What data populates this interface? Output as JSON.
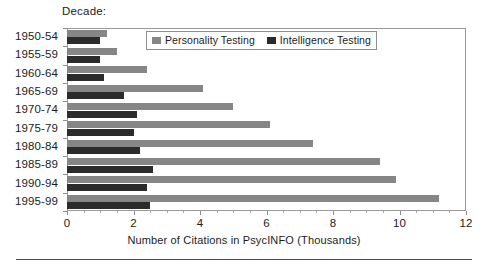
{
  "caption": "Decade:",
  "legend": {
    "items": [
      {
        "label": "Personality Testing",
        "color": "#868686",
        "swatch": "legend-swatch-personality"
      },
      {
        "label": "Intelligence Testing",
        "color": "#2b2b2b",
        "swatch": "legend-swatch-intelligence"
      }
    ]
  },
  "axis": {
    "x_title": "Number of Citations in PsycINFO (Thousands)",
    "x_ticks": [
      "0",
      "2",
      "4",
      "6",
      "8",
      "10",
      "12"
    ]
  },
  "chart_data": {
    "type": "bar",
    "orientation": "horizontal",
    "title": "",
    "subtitle": "",
    "xlabel": "Number of Citations in PsycINFO (Thousands)",
    "ylabel": "Decade:",
    "xlim": [
      0,
      12
    ],
    "xticks": [
      0,
      2,
      4,
      6,
      8,
      10,
      12
    ],
    "minor_tick_interval": 0.5,
    "grid": false,
    "legend_position": "top-center-inside",
    "categories": [
      "1950-54",
      "1955-59",
      "1960-64",
      "1965-69",
      "1970-74",
      "1975-79",
      "1980-84",
      "1985-89",
      "1990-94",
      "1995-99"
    ],
    "series": [
      {
        "name": "Personality Testing",
        "color": "#868686",
        "values": [
          1.2,
          1.5,
          2.4,
          4.1,
          5.0,
          6.1,
          7.4,
          9.4,
          9.9,
          11.2
        ]
      },
      {
        "name": "Intelligence Testing",
        "color": "#2b2b2b",
        "values": [
          1.0,
          1.0,
          1.1,
          1.7,
          2.1,
          2.0,
          2.2,
          2.6,
          2.4,
          2.5
        ]
      }
    ]
  }
}
